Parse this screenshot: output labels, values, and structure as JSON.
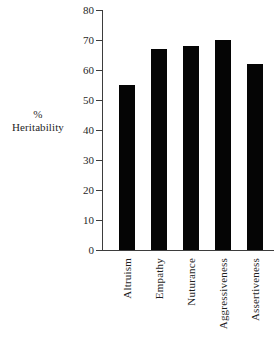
{
  "chart_data": {
    "type": "bar",
    "title": "",
    "subtitle": "",
    "xlabel": "",
    "ylabel": "% Heritability",
    "ylabel_lines": [
      "%",
      "Heritability"
    ],
    "categories": [
      "Altruism",
      "Empathy",
      "Nuturance",
      "Aggressiveness",
      "Assertiveness"
    ],
    "values": [
      55,
      67,
      68,
      70,
      62
    ],
    "ylim": [
      0,
      80
    ],
    "ytick_values": [
      0,
      10,
      20,
      30,
      40,
      50,
      60,
      70,
      80
    ],
    "ytick_labels": [
      "0",
      "10",
      "20",
      "30",
      "40",
      "50",
      "60",
      "70",
      "80"
    ],
    "grid": false,
    "legend": null,
    "bar_color": "#050505",
    "axis_color": "#3d3d3d",
    "background_color": "#ffffff"
  },
  "axis": {
    "y_title_line1": "%",
    "y_title_line2": "Heritability"
  }
}
